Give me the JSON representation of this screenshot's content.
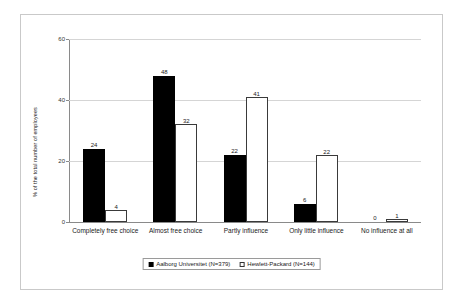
{
  "chart_data": {
    "type": "bar",
    "title": "",
    "subtitle": "",
    "xlabel": "",
    "ylabel": "% of the total number of employees",
    "ylim": [
      0,
      60
    ],
    "y_ticks": [
      0,
      20,
      40,
      60
    ],
    "grid": true,
    "legend_position": "bottom",
    "categories": [
      "Completely free choice",
      "Almost free choice",
      "Partly influence",
      "Only little influence",
      "No influence at all"
    ],
    "series": [
      {
        "name": "Aalborg Universitet (N=379)",
        "color": "#000000",
        "style": "filled",
        "values": [
          24,
          48,
          22,
          6,
          0
        ]
      },
      {
        "name": "Hewlett-Packard (N=144)",
        "color": "#ffffff",
        "style": "hollow",
        "values": [
          4,
          32,
          41,
          22,
          1
        ]
      }
    ]
  },
  "legend": {
    "entries": [
      {
        "label": "Aalborg Universitet (N=379)",
        "swatch": "filled-square-icon"
      },
      {
        "label": "Hewlett-Packard (N=144)",
        "swatch": "hollow-square-icon"
      }
    ]
  }
}
